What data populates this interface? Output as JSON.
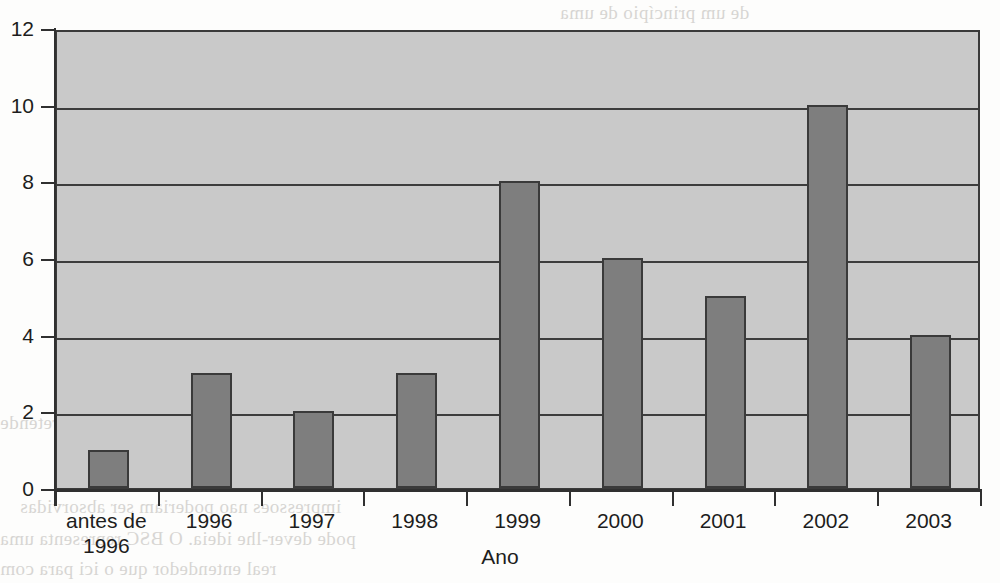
{
  "chart_data": {
    "type": "bar",
    "title": "",
    "xlabel": "Ano",
    "ylabel": "",
    "categories": [
      "antes de 1996",
      "1996",
      "1997",
      "1998",
      "1999",
      "2000",
      "2001",
      "2002",
      "2003"
    ],
    "category_lines": [
      [
        "antes de",
        "1996"
      ],
      [
        "1996"
      ],
      [
        "1997"
      ],
      [
        "1998"
      ],
      [
        "1999"
      ],
      [
        "2000"
      ],
      [
        "2001"
      ],
      [
        "2002"
      ],
      [
        "2003"
      ]
    ],
    "values": [
      1,
      3,
      2,
      3,
      8,
      6,
      5,
      10,
      4
    ],
    "ylim": [
      0,
      12
    ],
    "ytick_labels": [
      "12",
      "10",
      "8",
      "6",
      "4",
      "2",
      "0"
    ],
    "ytick_values": [
      12,
      10,
      8,
      6,
      4,
      2,
      0
    ],
    "grid": true,
    "grid_axis": "y",
    "legend": "none",
    "colors": {
      "bar_fill": "#7e7e7e",
      "bar_border": "#3a3a3a",
      "plot_background": "#c9c9c9",
      "axis": "#303030",
      "gridline": "#3c3c3c",
      "text": "#1d1d1d",
      "page_background": "#fdfdfc"
    }
  },
  "background_text": {
    "note": "faint mirrored bleed-through from the reverse page side",
    "lines": [
      "de um princípio de uma",
      "apresentado relativamente",
      "uma certa relevancia",
      "pontos de vista que",
      "sera necessario",
      "condicoes em que",
      "dados obtidos",
      "com o objectivo",
      "que se pretende",
      "impressoes nao poderiam ser absorvidas",
      "pode dever-lhe ideia. O BSC representa uma",
      "real entendedor que o ici para com"
    ]
  }
}
